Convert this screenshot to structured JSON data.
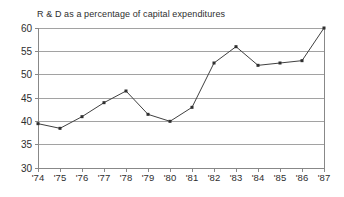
{
  "chart_data": {
    "type": "line",
    "title": "R & D as a percentage of capital expenditures",
    "categories": [
      "'74",
      "'75",
      "'76",
      "'77",
      "'78",
      "'79",
      "'80",
      "'81",
      "'82",
      "'83",
      "'84",
      "'85",
      "'86",
      "'87"
    ],
    "values": [
      39.5,
      38.5,
      41,
      44,
      46.5,
      41.5,
      40,
      43,
      52.5,
      56,
      52,
      52.5,
      53,
      60
    ],
    "xlabel": "",
    "ylabel": "",
    "ylim": [
      30,
      60
    ],
    "yticks": [
      30,
      35,
      40,
      45,
      50,
      55,
      60
    ],
    "grid": "horizontal",
    "legend_position": "none",
    "colors": {
      "background": "#ffffff",
      "gridline": "#a2a2a2",
      "frame": "#888888",
      "line": "#404040",
      "marker": "#2f2f2f",
      "tick_label": "#2e2e2e",
      "title": "#2e2e2e"
    }
  }
}
